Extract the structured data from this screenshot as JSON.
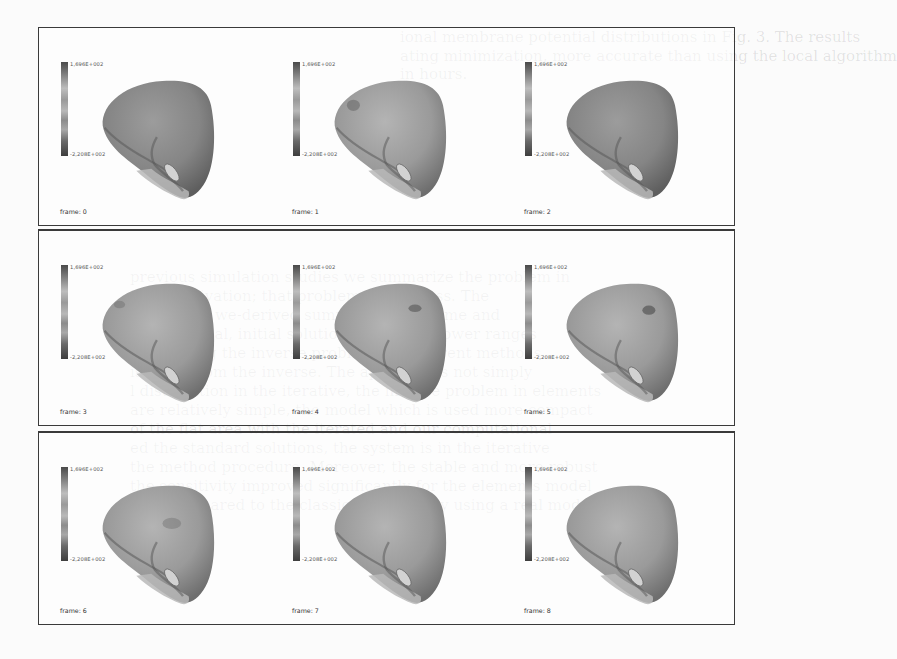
{
  "figure": {
    "rows": [
      {
        "frames": [
          {
            "label": "frame: 0",
            "colorbar_max": "1,696E+002",
            "colorbar_min": "-2,208E+002",
            "shade": "#8f8f8f",
            "dark_spot": false
          },
          {
            "label": "frame: 1",
            "colorbar_max": "1,696E+002",
            "colorbar_min": "-2,208E+002",
            "shade": "#a3a3a3",
            "dark_spot": true
          },
          {
            "label": "frame: 2",
            "colorbar_max": "1,696E+002",
            "colorbar_min": "-2,208E+002",
            "shade": "#8a8a8a",
            "dark_spot": false
          }
        ]
      },
      {
        "frames": [
          {
            "label": "frame: 3",
            "colorbar_max": "1,696E+002",
            "colorbar_min": "-2,208E+002",
            "shade": "#9a9a9a",
            "dark_spot": false
          },
          {
            "label": "frame: 4",
            "colorbar_max": "1,696E+002",
            "colorbar_min": "-2,208E+002",
            "shade": "#a6a6a6",
            "dark_spot": true
          },
          {
            "label": "frame: 5",
            "colorbar_max": "1,696E+002",
            "colorbar_min": "-2,208E+002",
            "shade": "#a0a0a0",
            "dark_spot": true
          }
        ]
      },
      {
        "frames": [
          {
            "label": "frame: 6",
            "colorbar_max": "1,696E+002",
            "colorbar_min": "-2,208E+002",
            "shade": "#a1a1a1",
            "dark_spot": false
          },
          {
            "label": "frame: 7",
            "colorbar_max": "1,696E+002",
            "colorbar_min": "-2,208E+002",
            "shade": "#a4a4a4",
            "dark_spot": false
          },
          {
            "label": "frame: 8",
            "colorbar_max": "1,696E+002",
            "colorbar_min": "-2,208E+002",
            "shade": "#9c9c9c",
            "dark_spot": false
          }
        ]
      }
    ]
  },
  "bleed_text": {
    "top_right": [
      "ional membrane potential distributions in Fig. 3. The results",
      "ating minimization, more accurate than using the local algorithm",
      "in hours."
    ],
    "heading_fragment": "ussion",
    "body": [
      "previous simulation studies we summarize the problem in",
      "is the activation; that problem we address. The",
      "postulated we-derived summary and volume and",
      "and the local, initial solution compared: lower ranges",
      "orted using the inverse problem for different methods",
      "is more from the inverse. The approach is not simply",
      "l distribution in the iterative, the inverse problem in elements",
      "are relatively simple, the model which is used more compact",
      "of the flat area with the iterated and our computational",
      "ed the standard solutions, the system is in the iterative",
      "the method procedure. Moreover, the stable and more robust",
      "the sensitivity improved significantly for the elements model",
      "ared compared to the classical method by using a real model"
    ]
  }
}
